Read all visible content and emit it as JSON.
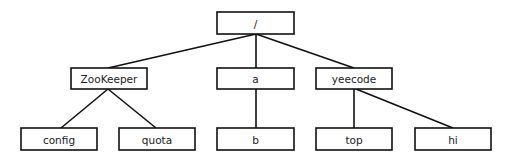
{
  "diagram": {
    "type": "tree",
    "title": "",
    "nodes": {
      "root": {
        "label": "/",
        "x": 217,
        "y": 12,
        "w": 77,
        "h": 22
      },
      "zookeeper": {
        "label": "ZooKeeper",
        "x": 71,
        "y": 68,
        "w": 76,
        "h": 21
      },
      "a": {
        "label": "a",
        "x": 217,
        "y": 68,
        "w": 77,
        "h": 21
      },
      "yeecode": {
        "label": "yeecode",
        "x": 316,
        "y": 68,
        "w": 76,
        "h": 21
      },
      "config": {
        "label": "config",
        "x": 21,
        "y": 128,
        "w": 76,
        "h": 22
      },
      "quota": {
        "label": "quota",
        "x": 119,
        "y": 128,
        "w": 76,
        "h": 22
      },
      "b": {
        "label": "b",
        "x": 217,
        "y": 128,
        "w": 77,
        "h": 22
      },
      "top": {
        "label": "top",
        "x": 316,
        "y": 128,
        "w": 76,
        "h": 22
      },
      "hi": {
        "label": "hi",
        "x": 415,
        "y": 128,
        "w": 76,
        "h": 22
      }
    },
    "edges": [
      {
        "from": "root",
        "to": "zookeeper",
        "x1": 256,
        "y1": 34,
        "x2": 108,
        "y2": 68
      },
      {
        "from": "root",
        "to": "a",
        "x1": 256,
        "y1": 34,
        "x2": 256,
        "y2": 68
      },
      {
        "from": "root",
        "to": "yeecode",
        "x1": 256,
        "y1": 34,
        "x2": 354,
        "y2": 68
      },
      {
        "from": "zookeeper",
        "to": "config",
        "x1": 108,
        "y1": 89,
        "x2": 61,
        "y2": 128
      },
      {
        "from": "zookeeper",
        "to": "quota",
        "x1": 108,
        "y1": 89,
        "x2": 156,
        "y2": 128
      },
      {
        "from": "a",
        "to": "b",
        "x1": 256,
        "y1": 89,
        "x2": 256,
        "y2": 128
      },
      {
        "from": "yeecode",
        "to": "top",
        "x1": 354,
        "y1": 89,
        "x2": 354,
        "y2": 128
      },
      {
        "from": "yeecode",
        "to": "hi",
        "x1": 356,
        "y1": 89,
        "x2": 453,
        "y2": 128
      }
    ],
    "colors": {
      "stroke": "#111111",
      "fill": "#ffffff",
      "text": "#222222"
    }
  }
}
